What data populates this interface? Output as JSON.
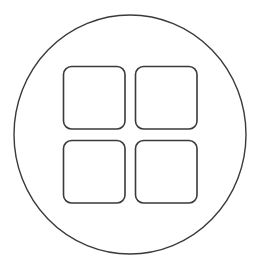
{
  "icon": {
    "name": "grid-apps-icon",
    "stroke_color": "#3a3a3a",
    "background": "#ffffff",
    "circle": {
      "cx": 130,
      "cy": 134.5,
      "rx": 116,
      "ry": 119.5,
      "stroke_width": 1.4
    },
    "tiles": [
      {
        "x": 63.5,
        "y": 66.5,
        "w": 61.5,
        "h": 62.5,
        "r": 8
      },
      {
        "x": 135.5,
        "y": 66.5,
        "w": 61.5,
        "h": 62.5,
        "r": 8
      },
      {
        "x": 63.5,
        "y": 140.5,
        "w": 61.5,
        "h": 62.5,
        "r": 8
      },
      {
        "x": 135.5,
        "y": 140.5,
        "w": 61.5,
        "h": 62.5,
        "r": 8
      }
    ],
    "tile_stroke_width": 1.6
  }
}
